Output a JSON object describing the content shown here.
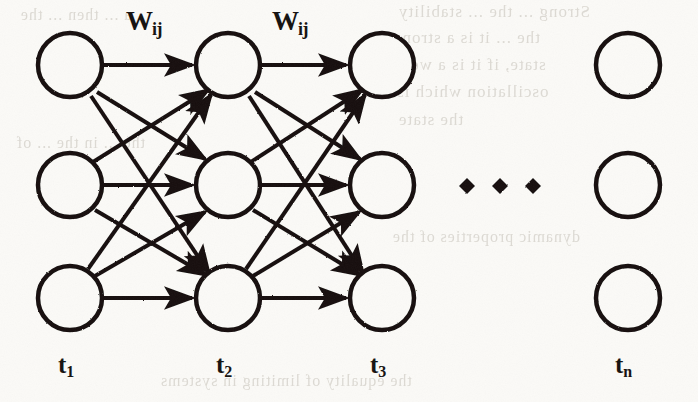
{
  "figure": {
    "type": "neural-network-diagram",
    "background_color": "#fbfaf7",
    "ink_color": "#14110f",
    "stroke_width": 4,
    "node_radius": 32,
    "canvas": {
      "width": 698,
      "height": 402
    }
  },
  "columns": [
    {
      "id": "t1",
      "label": "t",
      "subscript": "1",
      "x": 70,
      "label_x": 58,
      "label_y": 352,
      "has_nodes": true
    },
    {
      "id": "t2",
      "label": "t",
      "subscript": "2",
      "x": 228,
      "label_x": 216,
      "label_y": 352,
      "has_nodes": true
    },
    {
      "id": "t3",
      "label": "t",
      "subscript": "3",
      "x": 382,
      "label_x": 370,
      "label_y": 352,
      "has_nodes": true
    },
    {
      "id": "tn",
      "label": "t",
      "subscript": "n",
      "x": 628,
      "label_x": 615,
      "label_y": 352,
      "has_nodes": true
    }
  ],
  "rows": [
    {
      "id": "row1",
      "y": 65
    },
    {
      "id": "row2",
      "y": 185
    },
    {
      "id": "row3",
      "y": 298
    }
  ],
  "weight_labels": [
    {
      "id": "w-1-2",
      "text": "W",
      "subscript": "ij",
      "x": 126,
      "y": 8
    },
    {
      "id": "w-2-3",
      "text": "W",
      "subscript": "ij",
      "x": 272,
      "y": 8
    }
  ],
  "ellipsis": {
    "shape": "diamond",
    "count": 3,
    "y": 186,
    "size": 11,
    "x_positions": [
      467,
      500,
      533
    ]
  },
  "connections": {
    "description": "fully connected forward mesh between adjacent time columns",
    "layers": [
      {
        "from": "t1",
        "to": "t2",
        "mesh": "3x3",
        "arrowheads": true
      },
      {
        "from": "t2",
        "to": "t3",
        "mesh": "3x3",
        "arrowheads": true
      }
    ]
  },
  "bleed_through_text": [
    {
      "text": "Strong  ... the ... stability",
      "x": 398,
      "y": 2,
      "size": 17
    },
    {
      "text": "the ... it is a strong",
      "x": 392,
      "y": 28,
      "size": 17
    },
    {
      "text": "state, if it is a weak",
      "x": 392,
      "y": 55,
      "size": 17
    },
    {
      "text": "oscillation which is",
      "x": 396,
      "y": 82,
      "size": 17
    },
    {
      "text": "the state",
      "x": 398,
      "y": 110,
      "size": 17
    },
    {
      "text": "dynamic properties of the",
      "x": 392,
      "y": 228,
      "size": 16
    },
    {
      "text": "the equality of limiting  in systems",
      "x": 160,
      "y": 372,
      "size": 16
    },
    {
      "text": "the ... in the  ...  of",
      "x": 16,
      "y": 134,
      "size": 16
    },
    {
      "text": "a ... then ... the",
      "x": 20,
      "y": 6,
      "size": 16
    }
  ]
}
